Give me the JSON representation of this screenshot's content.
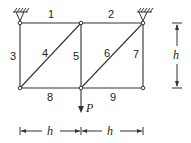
{
  "diagram": {
    "type": "truss",
    "members": [
      {
        "id": "1",
        "label": "1"
      },
      {
        "id": "2",
        "label": "2"
      },
      {
        "id": "3",
        "label": "3"
      },
      {
        "id": "4",
        "label": "4"
      },
      {
        "id": "5",
        "label": "5"
      },
      {
        "id": "6",
        "label": "6"
      },
      {
        "id": "7",
        "label": "7"
      },
      {
        "id": "8",
        "label": "8"
      },
      {
        "id": "9",
        "label": "9"
      }
    ],
    "load": {
      "label": "P"
    },
    "dimensions": {
      "vertical": "h",
      "horizontal_left": "h",
      "horizontal_right": "h"
    },
    "colors": {
      "line": "#333333",
      "background": "#ffffff"
    }
  }
}
